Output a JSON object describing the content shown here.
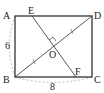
{
  "diagram": {
    "type": "geometry-rectangle",
    "points": {
      "A": {
        "label": "A",
        "x": 15,
        "y": 16
      },
      "B": {
        "label": "B",
        "x": 15,
        "y": 77
      },
      "C": {
        "label": "C",
        "x": 92,
        "y": 77
      },
      "D": {
        "label": "D",
        "x": 92,
        "y": 16
      },
      "E": {
        "label": "E",
        "x": 32,
        "y": 16
      },
      "F": {
        "label": "F",
        "x": 76,
        "y": 77
      },
      "O": {
        "label": "O",
        "x": 53,
        "y": 46
      }
    },
    "dimensions": {
      "AB": "6",
      "BC": "8"
    },
    "segments": [
      "AB",
      "BC",
      "CD",
      "DA",
      "BD",
      "EF"
    ],
    "right_angle_at": "O",
    "colors": {
      "line": "#333333",
      "dash": "#aaaaaa"
    }
  }
}
